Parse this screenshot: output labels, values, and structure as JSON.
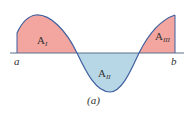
{
  "diagram": {
    "caption": "(a)",
    "endpoints": {
      "left": "a",
      "right": "b"
    },
    "regions": [
      {
        "id": "I",
        "label": "A",
        "subscript": "I",
        "sign": "positive",
        "color": "#f3a5a0"
      },
      {
        "id": "II",
        "label": "A",
        "subscript": "II",
        "sign": "negative",
        "color": "#b7d7e6"
      },
      {
        "id": "III",
        "label": "A",
        "subscript": "III",
        "sign": "positive",
        "color": "#f3a5a0"
      }
    ],
    "curve_color": "#3f5f9f",
    "axis_color": "#5a6f8a"
  }
}
